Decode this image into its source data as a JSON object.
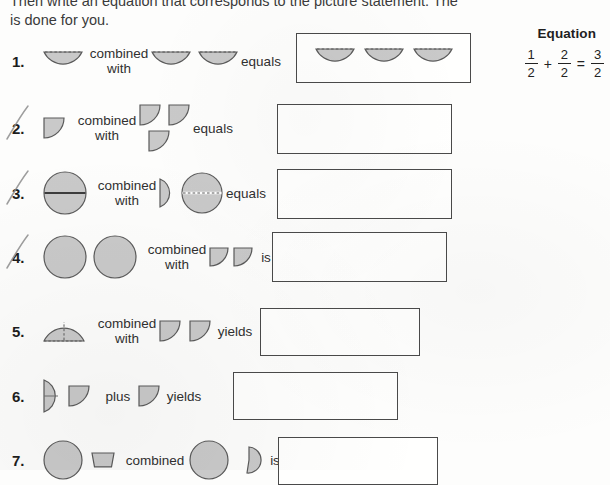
{
  "worksheet": {
    "intro_line1": "Then write an equation that corresponds to the picture statement. The first problem",
    "intro_line2": "is done for you.",
    "equation_header": "Equation"
  },
  "example_equation": {
    "term1": {
      "numerator": "1",
      "denominator": "2"
    },
    "operator_plus": "+",
    "term2": {
      "numerator": "2",
      "denominator": "2"
    },
    "operator_equals": "=",
    "result": {
      "numerator": "3",
      "denominator": "2"
    }
  },
  "shape_fill": "#c9c9c9",
  "shape_stroke": "#5a5a5a",
  "problems": [
    {
      "number": "1.",
      "struck_out": false,
      "connector": "combined\nwith",
      "connector_line1": "combined",
      "connector_line2": "with",
      "relation": "equals",
      "left_pieces": 1,
      "left_shape": "half-circle-bowl",
      "right_pieces": 2,
      "right_shape": "half-circle-bowl",
      "answer_pieces": 3,
      "answer_shape": "half-circle-bowl",
      "answer_filled": true
    },
    {
      "number": "2.",
      "struck_out": true,
      "connector_line1": "combined",
      "connector_line2": "with",
      "relation": "equals",
      "left_pieces": 1,
      "left_shape": "quarter-circle",
      "right_pieces": 3,
      "right_shape": "quarter-circle-stacked",
      "answer_pieces": 0,
      "answer_filled": false
    },
    {
      "number": "3.",
      "struck_out": true,
      "connector_line1": "combined",
      "connector_line2": "with",
      "relation": "equals",
      "left_pieces": 1,
      "left_shape": "circle-solid-divider",
      "right_pieces": 2,
      "right_shape": "half-circle-right-and-circle-dashed",
      "answer_pieces": 0,
      "answer_filled": false
    },
    {
      "number": "4.",
      "struck_out": true,
      "connector_line1": "combined",
      "connector_line2": "with",
      "relation": "is",
      "left_pieces": 2,
      "left_shape": "circle-plain",
      "right_pieces": 2,
      "right_shape": "quarter-circle",
      "answer_pieces": 0,
      "answer_filled": false
    },
    {
      "number": "5.",
      "struck_out": false,
      "connector_line1": "combined",
      "connector_line2": "with",
      "relation": "yields",
      "left_pieces": 1,
      "left_shape": "half-circle-dome-dashed",
      "right_pieces": 2,
      "right_shape": "quarter-circle",
      "answer_pieces": 0,
      "answer_filled": false
    },
    {
      "number": "6.",
      "struck_out": false,
      "connector_line1": "plus",
      "connector_line2": "",
      "relation": "yields",
      "left_pieces": 2,
      "left_shape": "half-circle-right-plus-quarter",
      "right_pieces": 1,
      "right_shape": "quarter-circle",
      "answer_pieces": 0,
      "answer_filled": false
    },
    {
      "number": "7.",
      "struck_out": false,
      "connector_line1": "combined",
      "connector_line2": "",
      "relation": "is",
      "left_pieces": 2,
      "left_shape": "circle-and-trapezoid",
      "right_pieces": 2,
      "right_shape": "circle-and-partial",
      "answer_pieces": 0,
      "answer_filled": false
    }
  ]
}
